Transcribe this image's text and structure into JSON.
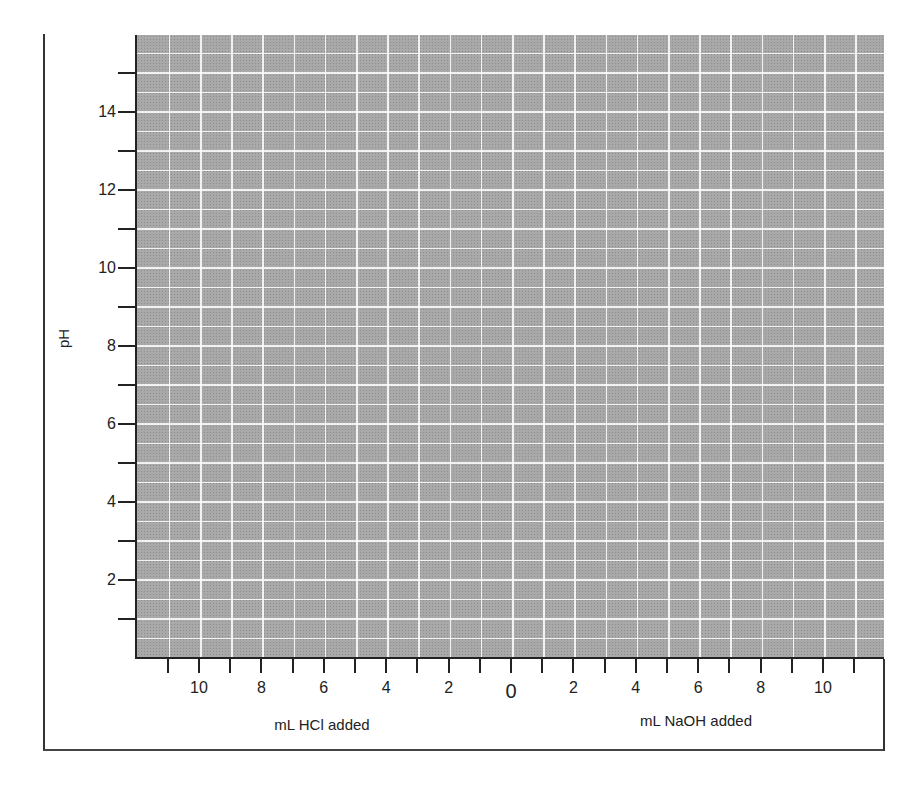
{
  "chart_data": {
    "type": "line",
    "title": "",
    "xlabel_left": "mL HCl added",
    "xlabel_right": "mL NaOH added",
    "ylabel": "pH",
    "grid": true,
    "x_ticks_left": [
      "10",
      "8",
      "6",
      "4",
      "2"
    ],
    "x_zero": "0",
    "x_ticks_right": [
      "2",
      "4",
      "6",
      "8",
      "10"
    ],
    "y_ticks": [
      "2",
      "4",
      "6",
      "8",
      "10",
      "12",
      "14"
    ],
    "xlim": [
      -12,
      12
    ],
    "ylim": [
      0,
      16
    ],
    "series": []
  },
  "colors": {
    "plot_bg": "#a9a9a9",
    "grid": "#ffffff",
    "axis": "#222222"
  }
}
